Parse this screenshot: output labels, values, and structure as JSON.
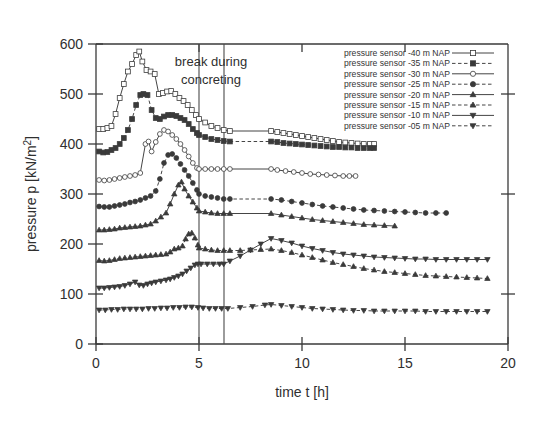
{
  "figure": {
    "background": "#ffffff",
    "ink_color": "#3a3a3a"
  },
  "annotations": {
    "break_line1": "break during",
    "break_line2": "concreting",
    "break_start_t": 5.0,
    "break_end_t": 6.2
  },
  "axes": {
    "x_title": "time t [h]",
    "y_title": "pressure p [kN/m²]",
    "x_ticks": [
      "0",
      "5",
      "10",
      "15",
      "20"
    ],
    "y_ticks": [
      "0",
      "100",
      "200",
      "300",
      "400",
      "500",
      "600"
    ]
  },
  "legend": {
    "position": "top-right",
    "entries": [
      {
        "label": "pressure sensor -40 m NAP",
        "marker": "square-open",
        "dash": "solid"
      },
      {
        "label": "pressure sensor -35 m NAP",
        "marker": "square-filled",
        "dash": "dashed"
      },
      {
        "label": "pressure sensor -30 m NAP",
        "marker": "circle-open",
        "dash": "solid"
      },
      {
        "label": "pressure sensor -25 m NAP",
        "marker": "circle-filled",
        "dash": "dashed"
      },
      {
        "label": "pressure sensor -20 m NAP",
        "marker": "triangle-up-filled",
        "dash": "solid"
      },
      {
        "label": "pressure sensor -15 m NAP",
        "marker": "triangle-up-filled",
        "dash": "dashed"
      },
      {
        "label": "pressure sensor -10 m NAP",
        "marker": "triangle-down-filled",
        "dash": "solid"
      },
      {
        "label": "pressure sensor -05 m NAP",
        "marker": "triangle-down-filled",
        "dash": "dashed"
      }
    ]
  },
  "chart_data": {
    "type": "line",
    "title": "",
    "xlabel": "time t [h]",
    "ylabel": "pressure p [kN/m²]",
    "xlim": [
      0,
      20
    ],
    "ylim": [
      0,
      600
    ],
    "xticks": [
      0,
      5,
      10,
      15,
      20
    ],
    "yticks": [
      0,
      100,
      200,
      300,
      400,
      500,
      600
    ],
    "grid": false,
    "legend_position": "top-right",
    "annotations": [
      {
        "text": "break during concreting",
        "x": 5.6,
        "y": 555
      },
      {
        "type": "vline",
        "x": 5.0
      },
      {
        "type": "vline",
        "x": 6.2
      }
    ],
    "series": [
      {
        "name": "pressure sensor -40 m NAP",
        "marker": "square-open",
        "dash": "solid",
        "x": [
          0.15,
          0.35,
          0.55,
          0.75,
          0.95,
          1.15,
          1.35,
          1.55,
          1.75,
          1.95,
          2.1,
          2.25,
          2.45,
          2.65,
          2.85,
          3.05,
          3.25,
          3.45,
          3.65,
          3.85,
          4.05,
          4.25,
          4.45,
          4.65,
          4.85,
          5.0,
          5.3,
          5.6,
          5.9,
          6.2,
          6.5,
          8.5,
          8.8,
          9.1,
          9.4,
          9.7,
          10.0,
          10.3,
          10.6,
          10.9,
          11.2,
          11.5,
          11.8,
          12.1,
          12.4,
          12.7,
          13.0,
          13.3,
          13.5
        ],
        "y": [
          430,
          430,
          432,
          436,
          460,
          492,
          520,
          545,
          560,
          578,
          585,
          565,
          548,
          545,
          540,
          500,
          502,
          505,
          506,
          500,
          492,
          486,
          478,
          468,
          458,
          450,
          443,
          436,
          432,
          428,
          426,
          426,
          424,
          422,
          420,
          418,
          416,
          414,
          412,
          410,
          408,
          406,
          404,
          403,
          402,
          401,
          400,
          400,
          400
        ]
      },
      {
        "name": "pressure sensor -35 m NAP",
        "marker": "square-filled",
        "dash": "dashed",
        "x": [
          0.15,
          0.35,
          0.55,
          0.75,
          0.95,
          1.15,
          1.35,
          1.55,
          1.75,
          1.95,
          2.15,
          2.3,
          2.5,
          2.7,
          2.9,
          3.1,
          3.3,
          3.5,
          3.7,
          3.9,
          4.1,
          4.3,
          4.5,
          4.7,
          4.9,
          5.0,
          5.3,
          5.6,
          5.9,
          6.2,
          6.5,
          8.5,
          8.8,
          9.1,
          9.4,
          9.7,
          10.0,
          10.3,
          10.6,
          10.9,
          11.2,
          11.5,
          11.8,
          12.1,
          12.4,
          12.7,
          13.0,
          13.3,
          13.5
        ],
        "y": [
          385,
          383,
          384,
          388,
          392,
          400,
          412,
          428,
          450,
          478,
          498,
          500,
          498,
          468,
          452,
          450,
          455,
          458,
          458,
          456,
          452,
          448,
          440,
          430,
          422,
          418,
          414,
          410,
          408,
          406,
          405,
          405,
          404,
          402,
          401,
          400,
          399,
          398,
          397,
          396,
          395,
          394,
          394,
          393,
          393,
          392,
          392,
          392,
          392
        ]
      },
      {
        "name": "pressure sensor -30 m NAP",
        "marker": "circle-open",
        "dash": "solid",
        "x": [
          0.15,
          0.4,
          0.65,
          0.9,
          1.15,
          1.4,
          1.65,
          1.9,
          2.15,
          2.4,
          2.55,
          2.7,
          2.9,
          3.1,
          3.3,
          3.5,
          3.7,
          3.9,
          4.1,
          4.3,
          4.5,
          4.7,
          4.9,
          5.0,
          5.3,
          5.6,
          5.9,
          6.2,
          6.5,
          8.5,
          8.8,
          9.2,
          9.6,
          10.0,
          10.4,
          10.8,
          11.2,
          11.6,
          12.0,
          12.3,
          12.6
        ],
        "y": [
          328,
          327,
          328,
          330,
          332,
          334,
          336,
          338,
          342,
          400,
          405,
          385,
          404,
          420,
          428,
          425,
          418,
          410,
          400,
          388,
          375,
          362,
          352,
          350,
          350,
          350,
          350,
          350,
          350,
          350,
          348,
          346,
          344,
          342,
          340,
          339,
          338,
          337,
          336,
          336,
          336
        ]
      },
      {
        "name": "pressure sensor -25 m NAP",
        "marker": "circle-filled",
        "dash": "dashed",
        "x": [
          0.15,
          0.4,
          0.65,
          0.9,
          1.15,
          1.4,
          1.65,
          1.9,
          2.15,
          2.4,
          2.65,
          2.9,
          3.1,
          3.3,
          3.5,
          3.7,
          3.9,
          4.1,
          4.3,
          4.5,
          4.7,
          4.9,
          5.0,
          5.3,
          5.6,
          5.9,
          6.2,
          6.5,
          8.5,
          9.0,
          9.5,
          10.0,
          10.5,
          11.0,
          11.5,
          12.0,
          12.5,
          13.0,
          13.5,
          14.0,
          14.5,
          15.0,
          15.5,
          16.0,
          16.5,
          17.0
        ],
        "y": [
          275,
          274,
          274,
          276,
          278,
          280,
          283,
          285,
          288,
          292,
          296,
          306,
          330,
          362,
          378,
          380,
          372,
          360,
          348,
          336,
          322,
          308,
          300,
          296,
          294,
          292,
          290,
          290,
          290,
          288,
          285,
          282,
          279,
          276,
          274,
          272,
          270,
          268,
          267,
          266,
          265,
          264,
          263,
          262,
          262,
          262
        ]
      },
      {
        "name": "pressure sensor -20 m NAP",
        "marker": "triangle-up-filled",
        "dash": "solid",
        "x": [
          0.15,
          0.4,
          0.65,
          0.9,
          1.15,
          1.4,
          1.65,
          1.9,
          2.15,
          2.4,
          2.65,
          2.9,
          3.15,
          3.4,
          3.6,
          3.8,
          4.0,
          4.15,
          4.3,
          4.5,
          4.7,
          4.9,
          5.0,
          5.3,
          5.6,
          5.9,
          6.2,
          6.5,
          8.5,
          9.0,
          9.5,
          10.0,
          10.5,
          11.0,
          11.5,
          12.0,
          12.5,
          13.0,
          13.5,
          14.0,
          14.5
        ],
        "y": [
          228,
          228,
          229,
          230,
          232,
          233,
          234,
          235,
          236,
          238,
          240,
          246,
          254,
          262,
          280,
          300,
          318,
          324,
          310,
          296,
          284,
          272,
          266,
          264,
          262,
          261,
          261,
          261,
          261,
          258,
          255,
          252,
          249,
          247,
          245,
          243,
          241,
          239,
          238,
          237,
          236
        ]
      },
      {
        "name": "pressure sensor -15 m NAP",
        "marker": "triangle-up-filled",
        "dash": "dashed",
        "x": [
          0.15,
          0.4,
          0.65,
          0.9,
          1.15,
          1.4,
          1.65,
          1.9,
          2.15,
          2.4,
          2.65,
          2.9,
          3.15,
          3.4,
          3.6,
          3.8,
          4.0,
          4.2,
          4.35,
          4.5,
          4.65,
          4.8,
          4.95,
          5.0,
          5.3,
          5.6,
          5.9,
          6.2,
          6.5,
          7.0,
          7.5,
          8.0,
          8.5,
          9.0,
          9.5,
          10.0,
          10.5,
          11.0,
          11.5,
          12.0,
          12.5,
          13.0,
          13.5,
          14.0,
          14.5,
          15.0,
          15.5,
          16.0,
          16.5,
          17.0,
          17.5,
          18.0,
          18.5,
          19.0
        ],
        "y": [
          167,
          166,
          167,
          169,
          171,
          172,
          173,
          174,
          175,
          176,
          177,
          178,
          179,
          180,
          184,
          190,
          192,
          196,
          210,
          220,
          222,
          212,
          198,
          192,
          190,
          188,
          187,
          187,
          187,
          187,
          188,
          189,
          190,
          187,
          183,
          178,
          173,
          168,
          163,
          159,
          155,
          151,
          148,
          145,
          143,
          141,
          139,
          137,
          136,
          135,
          134,
          133,
          132,
          131
        ]
      },
      {
        "name": "pressure sensor -10 m NAP",
        "marker": "triangle-down-filled",
        "dash": "solid",
        "x": [
          0.15,
          0.4,
          0.65,
          0.9,
          1.15,
          1.4,
          1.65,
          1.9,
          2.1,
          2.3,
          2.5,
          2.7,
          2.9,
          3.15,
          3.4,
          3.6,
          3.8,
          4.0,
          4.2,
          4.4,
          4.6,
          4.8,
          4.95,
          5.1,
          5.4,
          5.7,
          6.0,
          6.2,
          6.5,
          7.0,
          7.5,
          8.0,
          8.5,
          9.0,
          9.5,
          10.0,
          10.5,
          11.0,
          11.5,
          12.0,
          12.5,
          13.0,
          13.5,
          14.0,
          14.5,
          15.0,
          15.5,
          16.0,
          16.5,
          17.0,
          17.5,
          18.0,
          18.5,
          19.0
        ],
        "y": [
          112,
          112,
          113,
          114,
          115,
          117,
          120,
          124,
          118,
          117,
          120,
          122,
          124,
          126,
          128,
          130,
          133,
          136,
          140,
          146,
          152,
          158,
          160,
          160,
          160,
          160,
          160,
          160,
          166,
          176,
          188,
          200,
          211,
          207,
          202,
          196,
          191,
          187,
          183,
          180,
          178,
          176,
          174,
          173,
          172,
          171,
          170,
          170,
          169,
          169,
          169,
          169,
          169,
          169
        ]
      },
      {
        "name": "pressure sensor -05 m NAP",
        "marker": "triangle-down-filled",
        "dash": "dashed",
        "x": [
          0.15,
          0.45,
          0.75,
          1.05,
          1.35,
          1.65,
          1.95,
          2.25,
          2.55,
          2.85,
          3.15,
          3.45,
          3.75,
          4.05,
          4.35,
          4.65,
          4.95,
          5.2,
          5.5,
          5.8,
          6.1,
          6.4,
          7.0,
          7.6,
          8.2,
          8.5,
          9.0,
          9.5,
          10.0,
          10.5,
          11.0,
          11.5,
          12.0,
          12.5,
          13.0,
          13.5,
          14.0,
          14.5,
          15.0,
          15.5,
          16.0,
          16.5,
          17.0,
          17.5,
          18.0,
          18.5,
          19.0
        ],
        "y": [
          68,
          68,
          69,
          69,
          70,
          70,
          70,
          70,
          71,
          71,
          72,
          72,
          73,
          73,
          74,
          74,
          73,
          72,
          71,
          71,
          71,
          71,
          73,
          75,
          78,
          79,
          77,
          75,
          73,
          71,
          70,
          69,
          68,
          67,
          67,
          66,
          66,
          66,
          66,
          66,
          65,
          65,
          65,
          65,
          65,
          65,
          65
        ]
      }
    ]
  }
}
